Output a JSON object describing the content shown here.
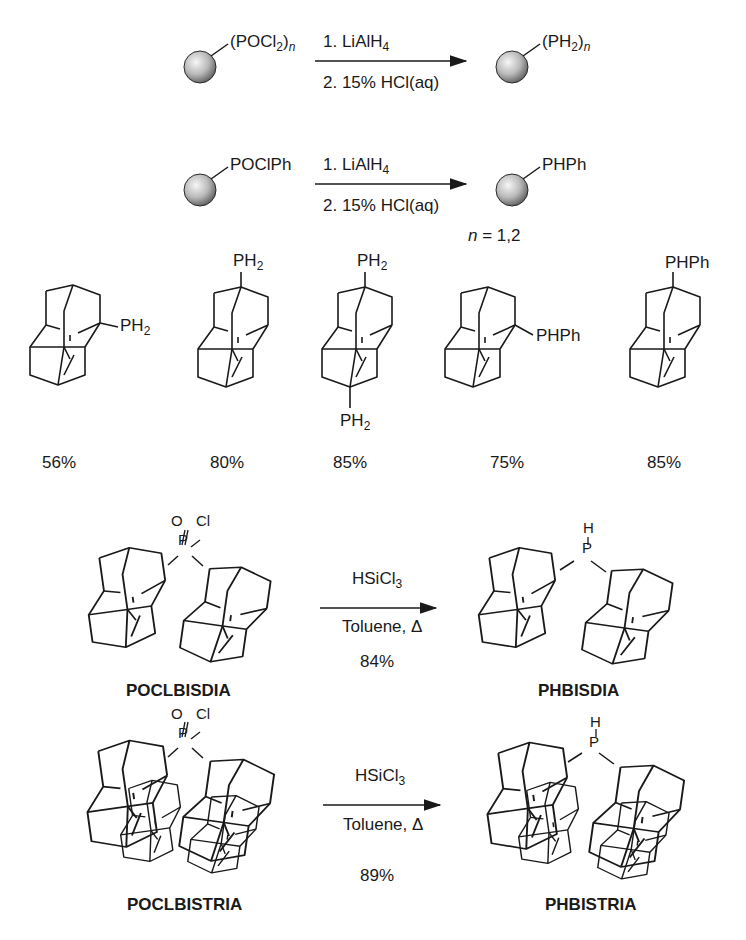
{
  "scheme": {
    "reaction1": {
      "reactant_group": "(POCl",
      "reactant_sub": "2",
      "reactant_close": ")",
      "reactant_n": "n",
      "step1": "1. LiAlH",
      "step1_sub": "4",
      "step2": "2. 15% HCl(aq)",
      "product_group": "(PH",
      "product_sub": "2",
      "product_close": ")",
      "product_n": "n"
    },
    "reaction2": {
      "reactant_group": "POClPh",
      "step1": "1. LiAlH",
      "step1_sub": "4",
      "step2": "2. 15% HCl(aq)",
      "product_group": "PHPh",
      "n_italic": "n",
      "n_note": " = 1,2"
    },
    "products": [
      {
        "substituent": "PH",
        "sub": "2",
        "position": "right",
        "yield": "56%"
      },
      {
        "substituent": "PH",
        "sub": "2",
        "position": "top",
        "yield": "80%"
      },
      {
        "substituent": "PH",
        "sub": "2",
        "position": "top-bottom",
        "second_substituent": "PH",
        "second_sub": "2",
        "yield": "85%"
      },
      {
        "substituent": "PHPh",
        "position": "right",
        "yield": "75%"
      },
      {
        "substituent": "PHPh",
        "position": "top",
        "yield": "85%"
      }
    ],
    "reaction3": {
      "reactant_label": "POCLBISDIA",
      "reactant_O": "O",
      "reactant_Cl": "Cl",
      "reactant_P": "P",
      "reagent": "HSiCl",
      "reagent_sub": "3",
      "conditions": "Toluene, Δ",
      "yield": "84%",
      "product_H": "H",
      "product_P": "P",
      "product_label": "PHBISDIA"
    },
    "reaction4": {
      "reactant_label": "POCLBISTRIA",
      "reactant_O": "O",
      "reactant_Cl": "Cl",
      "reactant_P": "P",
      "reagent": "HSiCl",
      "reagent_sub": "3",
      "conditions": "Toluene, Δ",
      "yield": "89%",
      "product_H": "H",
      "product_P": "P",
      "product_label": "PHBISTRIA"
    }
  },
  "colors": {
    "ink": "#1a1a1a",
    "sphere_light": "#f4f4f4",
    "sphere_dark": "#6a6a6a"
  }
}
